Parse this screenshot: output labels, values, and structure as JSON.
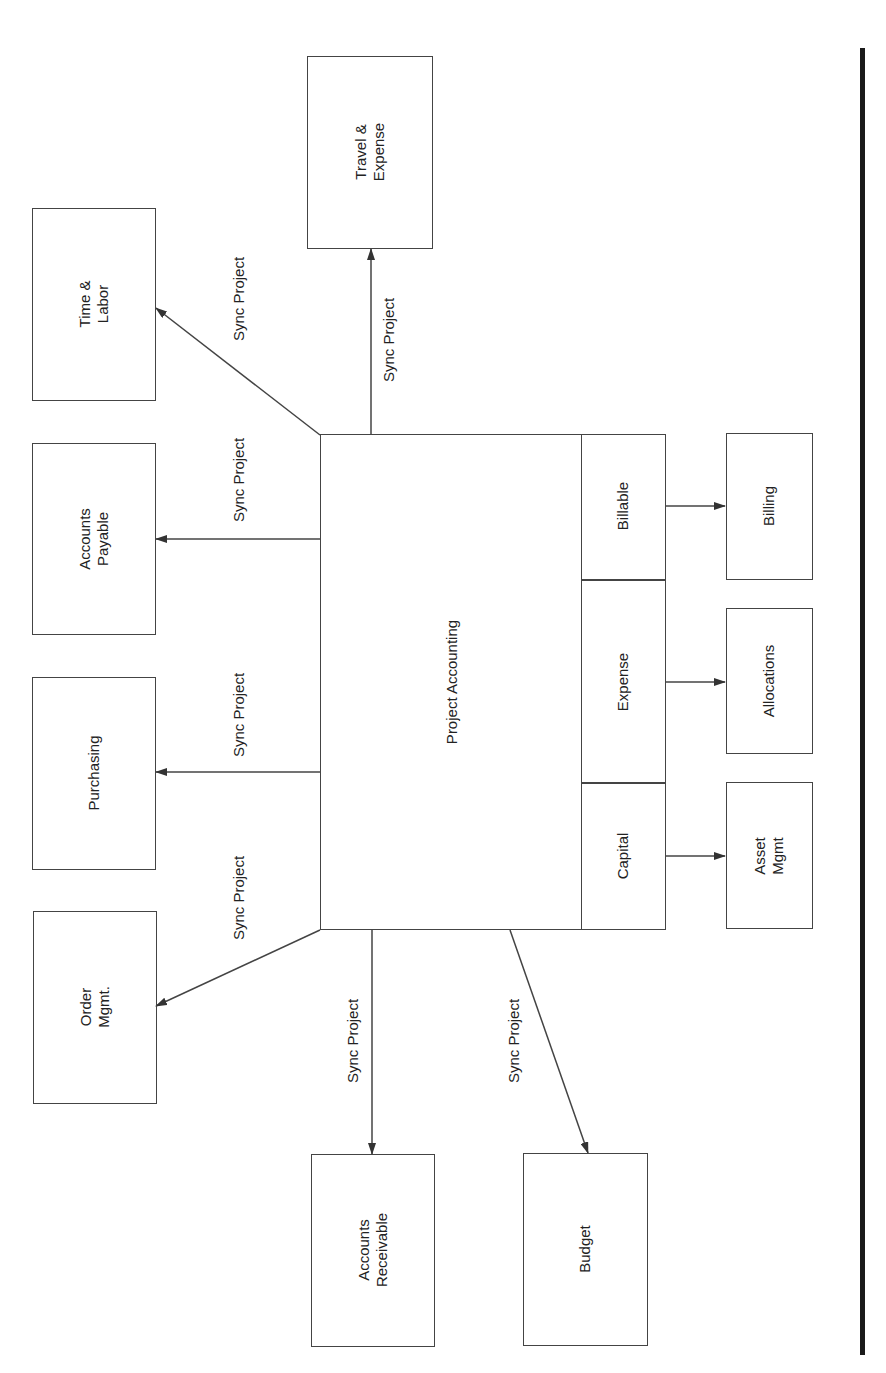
{
  "diagram": {
    "center": {
      "label": "Project Accounting",
      "sections": [
        {
          "label": "Billable"
        },
        {
          "label": "Expense"
        },
        {
          "label": "Capital"
        }
      ]
    },
    "nodes": {
      "time_labor": "Time &\nLabor",
      "travel_expense": "Travel &\nExpense",
      "accounts_payable": "Accounts\nPayable",
      "purchasing": "Purchasing",
      "order_mgmt": "Order\nMgmt.",
      "accounts_receivable": "Accounts\nReceivable",
      "budget": "Budget",
      "billing": "Billing",
      "allocations": "Allocations",
      "asset_mgmt": "Asset\nMgmt"
    },
    "edges": [
      {
        "from": "Project Accounting",
        "to": "Time & Labor",
        "label": "Sync Project"
      },
      {
        "from": "Project Accounting",
        "to": "Travel & Expense",
        "label": "Sync Project"
      },
      {
        "from": "Project Accounting",
        "to": "Accounts Payable",
        "label": "Sync Project"
      },
      {
        "from": "Project Accounting",
        "to": "Purchasing",
        "label": "Sync Project"
      },
      {
        "from": "Project Accounting",
        "to": "Order Mgmt.",
        "label": "Sync Project"
      },
      {
        "from": "Project Accounting",
        "to": "Accounts Receivable",
        "label": "Sync Project"
      },
      {
        "from": "Project Accounting",
        "to": "Budget",
        "label": "Sync Project"
      },
      {
        "from": "Billable",
        "to": "Billing",
        "label": ""
      },
      {
        "from": "Expense",
        "to": "Allocations",
        "label": ""
      },
      {
        "from": "Capital",
        "to": "Asset Mgmt",
        "label": ""
      }
    ]
  }
}
